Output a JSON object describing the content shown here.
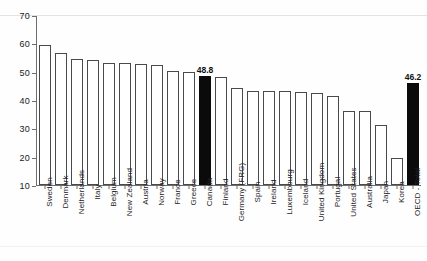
{
  "chart_data": {
    "type": "bar",
    "title": "",
    "subtitle": "",
    "xlabel": "",
    "ylabel": "",
    "ylim": [
      10,
      70
    ],
    "yticks": [
      10,
      20,
      30,
      40,
      50,
      60,
      70
    ],
    "grid": false,
    "legend": "none",
    "orientation": "vertical",
    "categories": [
      "Sweden",
      "Denmark",
      "Netherlands",
      "Italy",
      "Belgium",
      "New Zealand",
      "Austria",
      "Norway",
      "France",
      "Greece",
      "Canada",
      "Finland",
      "Germany (FRG)",
      "Spain",
      "Ireland",
      "Luxembourg",
      "Iceland",
      "United Kingdom",
      "Portugal",
      "United States",
      "Australia",
      "Japan",
      "Korea",
      "OECD - Total"
    ],
    "values": [
      59.8,
      57.0,
      54.6,
      54.3,
      53.2,
      53.2,
      52.9,
      52.7,
      50.5,
      50.0,
      48.8,
      48.2,
      44.6,
      43.5,
      43.4,
      43.4,
      43.2,
      42.5,
      41.5,
      36.4,
      36.3,
      31.3,
      19.5,
      46.2
    ],
    "highlighted": [
      "Canada",
      "OECD - Total"
    ],
    "data_labels": {
      "Canada": "48.8",
      "OECD - Total": "46.2"
    },
    "colors": {
      "bar_fill": "#ffffff",
      "bar_edge": "#4a4a4a",
      "highlight_fill": "#0b0b0b",
      "axis": "#6e6e6e",
      "text": "#1b1b1b",
      "background": "#ffffff"
    }
  }
}
